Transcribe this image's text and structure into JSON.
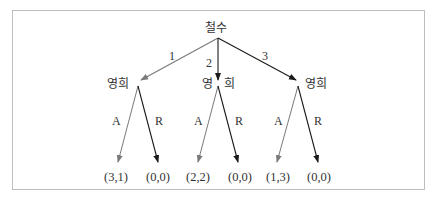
{
  "diagram": {
    "type": "game-tree",
    "root": {
      "player": "철수",
      "x": 218,
      "y": 38
    },
    "first_moves": [
      {
        "label": "1",
        "color": "#7a7a7a",
        "to_player": "영희",
        "node": {
          "x": 138,
          "y": 84
        }
      },
      {
        "label": "2",
        "color": "#1a1a1a",
        "to_player": "영",
        "to_player_suffix": "희",
        "node": {
          "x": 218,
          "y": 84
        }
      },
      {
        "label": "3",
        "color": "#1a1a1a",
        "to_player": "영희",
        "node": {
          "x": 298,
          "y": 84
        }
      }
    ],
    "responses": [
      {
        "accept_label": "A",
        "reject_label": "R",
        "accept_payoff": "(3,1)",
        "reject_payoff": "(0,0)"
      },
      {
        "accept_label": "A",
        "reject_label": "R",
        "accept_payoff": "(2,2)",
        "reject_payoff": "(0,0)"
      },
      {
        "accept_label": "A",
        "reject_label": "R",
        "accept_payoff": "(1,3)",
        "reject_payoff": "(0,0)"
      }
    ],
    "colors": {
      "gray_edge": "#7a7a7a",
      "black_edge": "#1a1a1a",
      "frame": "#bdbdbd"
    }
  }
}
